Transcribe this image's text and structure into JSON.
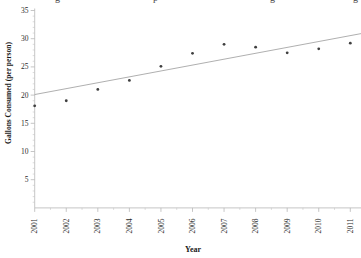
{
  "figure": {
    "clipped_title_fragments": [
      {
        "glyph": "g",
        "x": 55
      },
      {
        "glyph": "p",
        "x": 153
      },
      {
        "glyph": "g",
        "x": 270
      },
      {
        "glyph": "g",
        "x": 353
      }
    ]
  },
  "chart_data": {
    "type": "scatter",
    "title": "",
    "xlabel": "Year",
    "ylabel": "Gallons Consumed (per person)",
    "x": [
      2001,
      2002,
      2003,
      2004,
      2005,
      2006,
      2007,
      2008,
      2009,
      2010,
      2011
    ],
    "values": [
      18.1,
      19.0,
      21.0,
      22.6,
      25.1,
      27.4,
      29.0,
      28.5,
      27.5,
      28.2,
      29.2
    ],
    "trend_line": {
      "x1": 2001,
      "y1": 20.1,
      "x2": 2011.34,
      "y2": 30.9
    },
    "xlim": [
      2001,
      2011.34
    ],
    "ylim": [
      0,
      35
    ],
    "yticks": [
      5,
      10,
      15,
      20,
      25,
      30,
      35
    ],
    "y_minor_step": 1,
    "x_minor_step": 0.5,
    "grid": false,
    "legend": null,
    "colors": {
      "background": "#ffffff",
      "axis": "#b8b8b8",
      "minor_tick": "#c4c4c4",
      "tick_label": "#2b2b2b",
      "axis_title": "#1a1a1a",
      "point": "#3f3f3f",
      "trend": "#9a9a9a"
    }
  }
}
